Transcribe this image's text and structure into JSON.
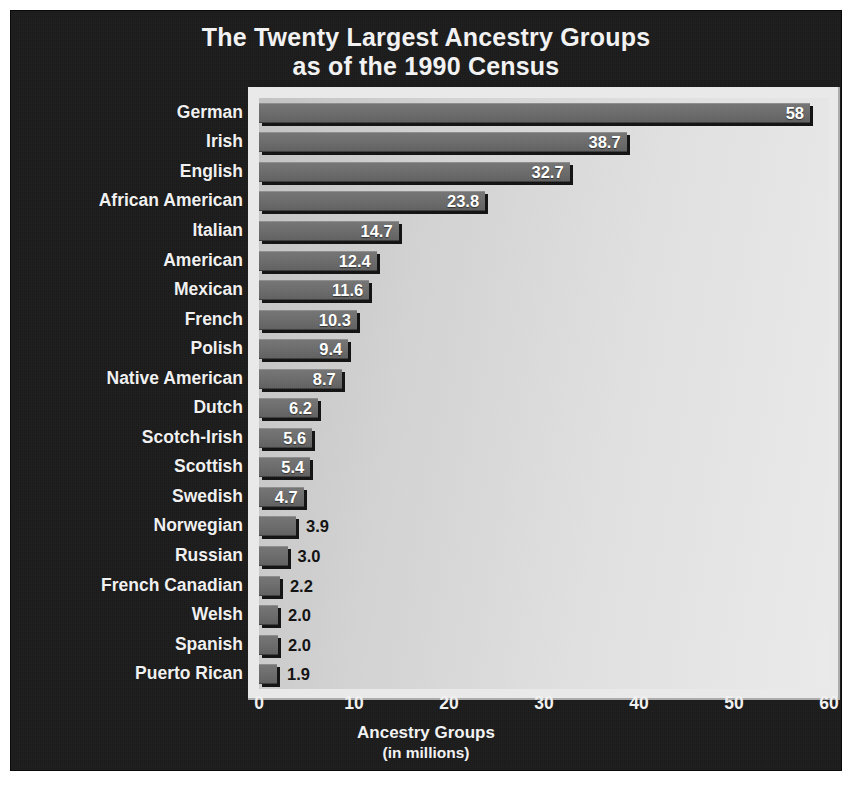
{
  "title": {
    "line1": "The Twenty Largest Ancestry Groups",
    "line2": "as of the 1990 Census"
  },
  "axis_title": {
    "line1": "Ancestry Groups",
    "line2": "(in millions)"
  },
  "colors": {
    "panel_background": "#1b1b1b",
    "plot_background": "#d6d6d6",
    "bar_fill": "#6c6c6c",
    "bar_shadow": "#121212",
    "text_light": "#f0f0f0",
    "text_dark": "#111111"
  },
  "chart_data": {
    "type": "bar",
    "orientation": "horizontal",
    "title": "The Twenty Largest Ancestry Groups as of the 1990 Census",
    "xlabel": "Ancestry Groups (in millions)",
    "ylabel": "",
    "xlim": [
      0,
      60
    ],
    "xticks": [
      0,
      10,
      20,
      30,
      40,
      50,
      60
    ],
    "xtick_labels": [
      "0",
      "10",
      "20",
      "30",
      "40",
      "50",
      "60"
    ],
    "grid": false,
    "legend": false,
    "categories": [
      "German",
      "Irish",
      "English",
      "African American",
      "Italian",
      "American",
      "Mexican",
      "French",
      "Polish",
      "Native American",
      "Dutch",
      "Scotch-Irish",
      "Scottish",
      "Swedish",
      "Norwegian",
      "Russian",
      "French Canadian",
      "Welsh",
      "Spanish",
      "Puerto Rican"
    ],
    "values": [
      58,
      38.7,
      32.7,
      23.8,
      14.7,
      12.4,
      11.6,
      10.3,
      9.4,
      8.7,
      6.2,
      5.6,
      5.4,
      4.7,
      3.9,
      3.0,
      2.2,
      2.0,
      2.0,
      1.9
    ],
    "value_labels": [
      "58",
      "38.7",
      "32.7",
      "23.8",
      "14.7",
      "12.4",
      "11.6",
      "10.3",
      "9.4",
      "8.7",
      "6.2",
      "5.6",
      "5.4",
      "4.7",
      "3.9",
      "3.0",
      "2.2",
      "2.0",
      "2.0",
      "1.9"
    ],
    "label_placement": [
      "inside",
      "inside",
      "inside",
      "inside",
      "inside",
      "inside",
      "inside",
      "inside",
      "inside",
      "inside",
      "inside",
      "inside",
      "inside",
      "inside",
      "outside",
      "outside",
      "outside",
      "outside",
      "outside",
      "outside"
    ]
  }
}
